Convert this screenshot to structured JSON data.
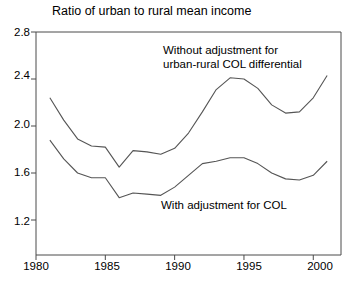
{
  "chart_data": {
    "type": "line",
    "title": "Ratio of urban to rural mean income",
    "xlabel": "",
    "ylabel": "",
    "xlim": [
      1980,
      2002
    ],
    "ylim": [
      1.2,
      2.8
    ],
    "grid": false,
    "legend_position": "inline-annotations",
    "xticks": [
      "1980",
      "1985",
      "1990",
      "1995",
      "2000"
    ],
    "xtick_values": [
      1980,
      1985,
      1990,
      1995,
      2000
    ],
    "yticks": [
      "1.2",
      "1.6",
      "2.0",
      "2.4",
      "2.8"
    ],
    "ytick_values": [
      1.2,
      1.6,
      2.0,
      2.4,
      2.8
    ],
    "x": [
      1981,
      1982,
      1983,
      1984,
      1985,
      1986,
      1987,
      1988,
      1989,
      1990,
      1991,
      1992,
      1993,
      1994,
      1995,
      1996,
      1997,
      1998,
      1999,
      2000,
      2001
    ],
    "series": [
      {
        "name": "Without adjustment for urban-rural COL differential",
        "annotation": "Without adjustment for\nurban-rural COL differential",
        "color": "#555555",
        "values": [
          2.24,
          2.05,
          1.89,
          1.83,
          1.82,
          1.65,
          1.79,
          1.78,
          1.76,
          1.81,
          1.94,
          2.12,
          2.31,
          2.41,
          2.4,
          2.32,
          2.18,
          2.11,
          2.12,
          2.24,
          2.43
        ]
      },
      {
        "name": "With adjustment for COL",
        "annotation": "With adjustment for COL",
        "color": "#555555",
        "values": [
          1.88,
          1.72,
          1.6,
          1.56,
          1.56,
          1.39,
          1.43,
          1.42,
          1.41,
          1.48,
          1.58,
          1.68,
          1.7,
          1.73,
          1.73,
          1.68,
          1.6,
          1.55,
          1.54,
          1.58,
          1.7
        ]
      }
    ]
  },
  "annotations": {
    "upper": "Without adjustment for\nurban-rural COL differential",
    "lower": "With adjustment for COL"
  },
  "colors": {
    "axis": "#4a4a4a",
    "line": "#555555",
    "background": "#ffffff",
    "text": "#000000"
  }
}
